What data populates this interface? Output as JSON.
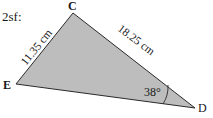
{
  "question_label": "2sf:",
  "triangle": {
    "fill": "#bdbdbd",
    "stroke": "#2a2a2a",
    "vertices": [
      {
        "name": "C",
        "x": 73,
        "y": 13
      },
      {
        "name": "E",
        "x": 16,
        "y": 84
      },
      {
        "name": "D",
        "x": 195,
        "y": 108
      }
    ],
    "vertex_labels": {
      "C": "C",
      "E": "E",
      "D": "D"
    },
    "sides": {
      "CE": "11.35 cm",
      "CD": "18.25 cm"
    },
    "angle": {
      "at": "D",
      "value": "38°"
    }
  }
}
